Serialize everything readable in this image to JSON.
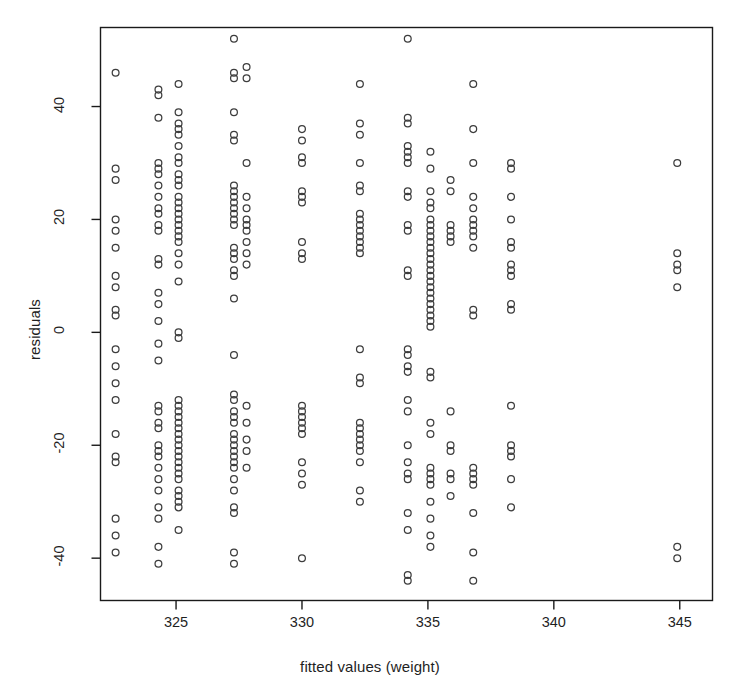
{
  "chart_data": {
    "type": "scatter",
    "title": "",
    "xlabel": "fitted values (weight)",
    "ylabel": "residuals",
    "xlim": [
      322.0,
      346.3
    ],
    "ylim": [
      -47.5,
      54.0
    ],
    "xticks": [
      325,
      330,
      335,
      340,
      345
    ],
    "yticks": [
      -40,
      -20,
      0,
      20,
      40
    ],
    "xtick_labels": [
      "325",
      "330",
      "335",
      "340",
      "345"
    ],
    "ytick_labels": [
      "-40",
      "-20",
      "0",
      "20",
      "40"
    ],
    "grid": false,
    "legend": null,
    "marker": "open-circle",
    "marker_color": "#3d3d3d",
    "marker_radius_px": 3.4,
    "frame": true,
    "series": [
      {
        "name": "residuals vs fitted",
        "points": [
          [
            322.6,
            46
          ],
          [
            322.6,
            29
          ],
          [
            322.6,
            27
          ],
          [
            322.6,
            20
          ],
          [
            322.6,
            18
          ],
          [
            322.6,
            15
          ],
          [
            322.6,
            10
          ],
          [
            322.6,
            8
          ],
          [
            322.6,
            4
          ],
          [
            322.6,
            3
          ],
          [
            322.6,
            -3
          ],
          [
            322.6,
            -6
          ],
          [
            322.6,
            -9
          ],
          [
            322.6,
            -12
          ],
          [
            322.6,
            -18
          ],
          [
            322.6,
            -22
          ],
          [
            322.6,
            -23
          ],
          [
            322.6,
            -33
          ],
          [
            322.6,
            -36
          ],
          [
            322.6,
            -39
          ],
          [
            324.3,
            43
          ],
          [
            324.3,
            42
          ],
          [
            324.3,
            38
          ],
          [
            324.3,
            30
          ],
          [
            324.3,
            29
          ],
          [
            324.3,
            28
          ],
          [
            324.3,
            26
          ],
          [
            324.3,
            24
          ],
          [
            324.3,
            22
          ],
          [
            324.3,
            21
          ],
          [
            324.3,
            19
          ],
          [
            324.3,
            18
          ],
          [
            324.3,
            13
          ],
          [
            324.3,
            12
          ],
          [
            324.3,
            7
          ],
          [
            324.3,
            5
          ],
          [
            324.3,
            2
          ],
          [
            324.3,
            -2
          ],
          [
            324.3,
            -5
          ],
          [
            324.3,
            -13
          ],
          [
            324.3,
            -14
          ],
          [
            324.3,
            -16
          ],
          [
            324.3,
            -17
          ],
          [
            324.3,
            -20
          ],
          [
            324.3,
            -21
          ],
          [
            324.3,
            -22
          ],
          [
            324.3,
            -24
          ],
          [
            324.3,
            -26
          ],
          [
            324.3,
            -28
          ],
          [
            324.3,
            -31
          ],
          [
            324.3,
            -33
          ],
          [
            324.3,
            -38
          ],
          [
            324.3,
            -41
          ],
          [
            325.1,
            44
          ],
          [
            325.1,
            39
          ],
          [
            325.1,
            37
          ],
          [
            325.1,
            36
          ],
          [
            325.1,
            35
          ],
          [
            325.1,
            33
          ],
          [
            325.1,
            31
          ],
          [
            325.1,
            30
          ],
          [
            325.1,
            28
          ],
          [
            325.1,
            27
          ],
          [
            325.1,
            26
          ],
          [
            325.1,
            24
          ],
          [
            325.1,
            23
          ],
          [
            325.1,
            22
          ],
          [
            325.1,
            21
          ],
          [
            325.1,
            20
          ],
          [
            325.1,
            19
          ],
          [
            325.1,
            18
          ],
          [
            325.1,
            17
          ],
          [
            325.1,
            16
          ],
          [
            325.1,
            14
          ],
          [
            325.1,
            12
          ],
          [
            325.1,
            9
          ],
          [
            325.1,
            0
          ],
          [
            325.1,
            -1
          ],
          [
            325.1,
            -12
          ],
          [
            325.1,
            -13
          ],
          [
            325.1,
            -14
          ],
          [
            325.1,
            -15
          ],
          [
            325.1,
            -16
          ],
          [
            325.1,
            -17
          ],
          [
            325.1,
            -18
          ],
          [
            325.1,
            -19
          ],
          [
            325.1,
            -20
          ],
          [
            325.1,
            -21
          ],
          [
            325.1,
            -22
          ],
          [
            325.1,
            -23
          ],
          [
            325.1,
            -24
          ],
          [
            325.1,
            -25
          ],
          [
            325.1,
            -26
          ],
          [
            325.1,
            -28
          ],
          [
            325.1,
            -29
          ],
          [
            325.1,
            -30
          ],
          [
            325.1,
            -31
          ],
          [
            325.1,
            -35
          ],
          [
            327.3,
            52
          ],
          [
            327.3,
            46
          ],
          [
            327.3,
            45
          ],
          [
            327.3,
            39
          ],
          [
            327.3,
            35
          ],
          [
            327.3,
            34
          ],
          [
            327.3,
            26
          ],
          [
            327.3,
            25
          ],
          [
            327.3,
            24
          ],
          [
            327.3,
            23
          ],
          [
            327.3,
            22
          ],
          [
            327.3,
            21
          ],
          [
            327.3,
            20
          ],
          [
            327.3,
            19
          ],
          [
            327.3,
            15
          ],
          [
            327.3,
            14
          ],
          [
            327.3,
            13
          ],
          [
            327.3,
            11
          ],
          [
            327.3,
            10
          ],
          [
            327.3,
            6
          ],
          [
            327.3,
            -4
          ],
          [
            327.3,
            -11
          ],
          [
            327.3,
            -12
          ],
          [
            327.3,
            -14
          ],
          [
            327.3,
            -15
          ],
          [
            327.3,
            -16
          ],
          [
            327.3,
            -18
          ],
          [
            327.3,
            -19
          ],
          [
            327.3,
            -20
          ],
          [
            327.3,
            -21
          ],
          [
            327.3,
            -22
          ],
          [
            327.3,
            -23
          ],
          [
            327.3,
            -24
          ],
          [
            327.3,
            -26
          ],
          [
            327.3,
            -28
          ],
          [
            327.3,
            -31
          ],
          [
            327.3,
            -32
          ],
          [
            327.3,
            -39
          ],
          [
            327.3,
            -41
          ],
          [
            327.8,
            47
          ],
          [
            327.8,
            45
          ],
          [
            327.8,
            30
          ],
          [
            327.8,
            24
          ],
          [
            327.8,
            22
          ],
          [
            327.8,
            20
          ],
          [
            327.8,
            19
          ],
          [
            327.8,
            18
          ],
          [
            327.8,
            16
          ],
          [
            327.8,
            14
          ],
          [
            327.8,
            12
          ],
          [
            327.8,
            -13
          ],
          [
            327.8,
            -16
          ],
          [
            327.8,
            -19
          ],
          [
            327.8,
            -21
          ],
          [
            327.8,
            -24
          ],
          [
            330.0,
            36
          ],
          [
            330.0,
            34
          ],
          [
            330.0,
            31
          ],
          [
            330.0,
            30
          ],
          [
            330.0,
            25
          ],
          [
            330.0,
            24
          ],
          [
            330.0,
            23
          ],
          [
            330.0,
            16
          ],
          [
            330.0,
            14
          ],
          [
            330.0,
            13
          ],
          [
            330.0,
            -13
          ],
          [
            330.0,
            -14
          ],
          [
            330.0,
            -15
          ],
          [
            330.0,
            -16
          ],
          [
            330.0,
            -17
          ],
          [
            330.0,
            -18
          ],
          [
            330.0,
            -23
          ],
          [
            330.0,
            -25
          ],
          [
            330.0,
            -27
          ],
          [
            330.0,
            -40
          ],
          [
            332.3,
            44
          ],
          [
            332.3,
            37
          ],
          [
            332.3,
            35
          ],
          [
            332.3,
            30
          ],
          [
            332.3,
            26
          ],
          [
            332.3,
            25
          ],
          [
            332.3,
            21
          ],
          [
            332.3,
            20
          ],
          [
            332.3,
            19
          ],
          [
            332.3,
            18
          ],
          [
            332.3,
            17
          ],
          [
            332.3,
            16
          ],
          [
            332.3,
            15
          ],
          [
            332.3,
            14
          ],
          [
            332.3,
            -3
          ],
          [
            332.3,
            -8
          ],
          [
            332.3,
            -9
          ],
          [
            332.3,
            -16
          ],
          [
            332.3,
            -17
          ],
          [
            332.3,
            -18
          ],
          [
            332.3,
            -19
          ],
          [
            332.3,
            -20
          ],
          [
            332.3,
            -21
          ],
          [
            332.3,
            -23
          ],
          [
            332.3,
            -28
          ],
          [
            332.3,
            -30
          ],
          [
            334.2,
            52
          ],
          [
            334.2,
            38
          ],
          [
            334.2,
            37
          ],
          [
            334.2,
            33
          ],
          [
            334.2,
            32
          ],
          [
            334.2,
            31
          ],
          [
            334.2,
            30
          ],
          [
            334.2,
            25
          ],
          [
            334.2,
            24
          ],
          [
            334.2,
            19
          ],
          [
            334.2,
            18
          ],
          [
            334.2,
            11
          ],
          [
            334.2,
            10
          ],
          [
            334.2,
            -3
          ],
          [
            334.2,
            -4
          ],
          [
            334.2,
            -6
          ],
          [
            334.2,
            -7
          ],
          [
            334.2,
            -12
          ],
          [
            334.2,
            -14
          ],
          [
            334.2,
            -20
          ],
          [
            334.2,
            -23
          ],
          [
            334.2,
            -25
          ],
          [
            334.2,
            -26
          ],
          [
            334.2,
            -32
          ],
          [
            334.2,
            -35
          ],
          [
            334.2,
            -43
          ],
          [
            334.2,
            -44
          ],
          [
            335.1,
            32
          ],
          [
            335.1,
            29
          ],
          [
            335.1,
            25
          ],
          [
            335.1,
            23
          ],
          [
            335.1,
            22
          ],
          [
            335.1,
            20
          ],
          [
            335.1,
            19
          ],
          [
            335.1,
            18
          ],
          [
            335.1,
            17
          ],
          [
            335.1,
            16
          ],
          [
            335.1,
            15
          ],
          [
            335.1,
            14
          ],
          [
            335.1,
            13
          ],
          [
            335.1,
            12
          ],
          [
            335.1,
            11
          ],
          [
            335.1,
            10
          ],
          [
            335.1,
            9
          ],
          [
            335.1,
            8
          ],
          [
            335.1,
            7
          ],
          [
            335.1,
            6
          ],
          [
            335.1,
            5
          ],
          [
            335.1,
            4
          ],
          [
            335.1,
            3
          ],
          [
            335.1,
            2
          ],
          [
            335.1,
            1
          ],
          [
            335.1,
            -7
          ],
          [
            335.1,
            -8
          ],
          [
            335.1,
            -16
          ],
          [
            335.1,
            -18
          ],
          [
            335.1,
            -24
          ],
          [
            335.1,
            -25
          ],
          [
            335.1,
            -26
          ],
          [
            335.1,
            -27
          ],
          [
            335.1,
            -30
          ],
          [
            335.1,
            -33
          ],
          [
            335.1,
            -36
          ],
          [
            335.1,
            -38
          ],
          [
            335.9,
            27
          ],
          [
            335.9,
            25
          ],
          [
            335.9,
            19
          ],
          [
            335.9,
            18
          ],
          [
            335.9,
            17
          ],
          [
            335.9,
            16
          ],
          [
            335.9,
            -14
          ],
          [
            335.9,
            -20
          ],
          [
            335.9,
            -21
          ],
          [
            335.9,
            -25
          ],
          [
            335.9,
            -26
          ],
          [
            335.9,
            -29
          ],
          [
            336.8,
            44
          ],
          [
            336.8,
            36
          ],
          [
            336.8,
            30
          ],
          [
            336.8,
            24
          ],
          [
            336.8,
            22
          ],
          [
            336.8,
            20
          ],
          [
            336.8,
            19
          ],
          [
            336.8,
            18
          ],
          [
            336.8,
            17
          ],
          [
            336.8,
            15
          ],
          [
            336.8,
            4
          ],
          [
            336.8,
            3
          ],
          [
            336.8,
            -24
          ],
          [
            336.8,
            -25
          ],
          [
            336.8,
            -26
          ],
          [
            336.8,
            -27
          ],
          [
            336.8,
            -32
          ],
          [
            336.8,
            -39
          ],
          [
            336.8,
            -44
          ],
          [
            338.3,
            30
          ],
          [
            338.3,
            29
          ],
          [
            338.3,
            24
          ],
          [
            338.3,
            20
          ],
          [
            338.3,
            16
          ],
          [
            338.3,
            15
          ],
          [
            338.3,
            12
          ],
          [
            338.3,
            11
          ],
          [
            338.3,
            10
          ],
          [
            338.3,
            5
          ],
          [
            338.3,
            4
          ],
          [
            338.3,
            -13
          ],
          [
            338.3,
            -20
          ],
          [
            338.3,
            -21
          ],
          [
            338.3,
            -22
          ],
          [
            338.3,
            -26
          ],
          [
            338.3,
            -31
          ],
          [
            344.9,
            30
          ],
          [
            344.9,
            14
          ],
          [
            344.9,
            12
          ],
          [
            344.9,
            11
          ],
          [
            344.9,
            8
          ],
          [
            344.9,
            -38
          ],
          [
            344.9,
            -40
          ]
        ]
      }
    ]
  }
}
